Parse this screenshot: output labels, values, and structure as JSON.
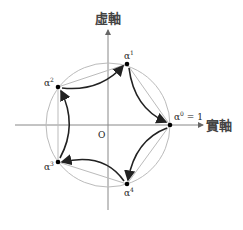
{
  "axes": {
    "imaginary_label": "虛軸",
    "real_label": "實軸",
    "origin_label": "O"
  },
  "points": [
    {
      "id": "alpha0",
      "label": "α",
      "sup": "0",
      "suffix": " = 1",
      "x": 170,
      "y": 125
    },
    {
      "id": "alpha1",
      "label": "α",
      "sup": "1",
      "suffix": "",
      "x": 127,
      "y": 64
    },
    {
      "id": "alpha2",
      "label": "α",
      "sup": "2",
      "suffix": "",
      "x": 58,
      "y": 87
    },
    {
      "id": "alpha3",
      "label": "α",
      "sup": "3",
      "suffix": "",
      "x": 58,
      "y": 162
    },
    {
      "id": "alpha4",
      "label": "α",
      "sup": "4",
      "suffix": "",
      "x": 127,
      "y": 184
    }
  ],
  "circle": {
    "cx": 108,
    "cy": 125,
    "r": 62
  },
  "colors": {
    "axis": "#888888",
    "circle": "#bbbbbb",
    "chord": "#bbbbbb",
    "arrow": "#222222",
    "point": "#000000"
  }
}
